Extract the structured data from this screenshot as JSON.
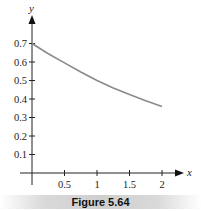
{
  "chart_data": {
    "type": "line",
    "title": "",
    "xlabel": "x",
    "ylabel": "y",
    "xlim": [
      0,
      2.3
    ],
    "ylim": [
      0,
      0.75
    ],
    "x_ticks": [
      0.5,
      1,
      1.5,
      2
    ],
    "x_tick_labels": [
      "0.5",
      "1",
      "1.5",
      "2"
    ],
    "y_ticks": [
      0.1,
      0.2,
      0.3,
      0.4,
      0.5,
      0.6,
      0.7
    ],
    "y_tick_labels": [
      "0.1",
      "0.2",
      "0.3",
      "0.4",
      "0.5",
      "0.6",
      "0.7"
    ],
    "grid": false,
    "legend": null,
    "series": [
      {
        "name": "curve",
        "color": "#8a8a8a",
        "x": [
          0,
          0.25,
          0.5,
          0.75,
          1,
          1.25,
          1.5,
          1.75,
          2
        ],
        "y": [
          0.7,
          0.645,
          0.595,
          0.546,
          0.5,
          0.46,
          0.425,
          0.39,
          0.36
        ]
      }
    ]
  },
  "caption": "Figure 5.64"
}
